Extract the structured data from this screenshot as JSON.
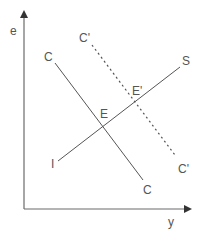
{
  "diagram": {
    "type": "economic-equilibrium-diagram",
    "colors": {
      "axis": "#6b6b6b",
      "line": "#555555",
      "label": "#555555",
      "background": "#ffffff"
    },
    "axes": {
      "x_label": "y",
      "y_label": "e"
    },
    "curves": [
      {
        "name": "C",
        "style": "solid",
        "label_start": "C",
        "label_end": "C"
      },
      {
        "name": "C'",
        "style": "dotted",
        "label_start": "C'",
        "label_end": "C'"
      },
      {
        "name": "S",
        "style": "solid",
        "label_start": "I",
        "label_end": "S"
      }
    ],
    "points": [
      {
        "label": "E"
      },
      {
        "label": "E'"
      }
    ]
  }
}
